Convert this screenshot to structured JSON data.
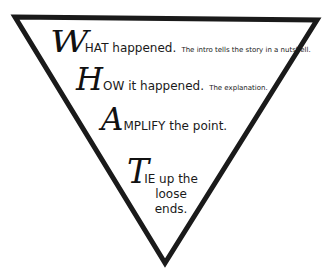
{
  "diagram": {
    "type": "inverted-triangle",
    "stroke_color": "#1a1a1a",
    "background": "#ffffff",
    "vertices": {
      "top_left": [
        15,
        17
      ],
      "top_right": [
        317,
        20
      ],
      "bottom": [
        165,
        263
      ]
    }
  },
  "lines": [
    {
      "initial": "W",
      "main": "HAT happened.",
      "detail": "The intro tells the story in a nutshell."
    },
    {
      "initial": "H",
      "main": "OW it happened.",
      "detail": "The explanation."
    },
    {
      "initial": "A",
      "main": "MPLIFY the point.",
      "detail": ""
    },
    {
      "initial": "T",
      "main": "IE up the",
      "continued": [
        "loose",
        "ends."
      ]
    }
  ]
}
